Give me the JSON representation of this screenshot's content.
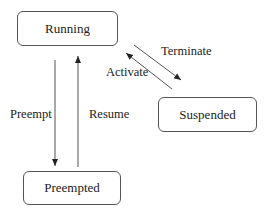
{
  "diagram": {
    "type": "state-transition",
    "states": [
      {
        "id": "running",
        "label": "Running"
      },
      {
        "id": "suspended",
        "label": "Suspended"
      },
      {
        "id": "preempted",
        "label": "Preempted"
      }
    ],
    "transitions": [
      {
        "from": "running",
        "to": "suspended",
        "label": "Terminate"
      },
      {
        "from": "suspended",
        "to": "running",
        "label": "Activate"
      },
      {
        "from": "running",
        "to": "preempted",
        "label": "Preempt"
      },
      {
        "from": "preempted",
        "to": "running",
        "label": "Resume"
      }
    ],
    "colors": {
      "stroke": "#555555",
      "text": "#222222",
      "background": "#ffffff"
    }
  }
}
